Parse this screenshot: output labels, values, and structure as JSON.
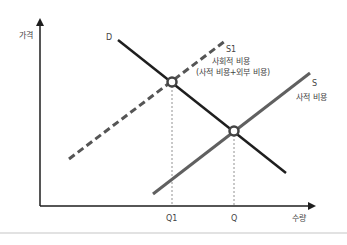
{
  "diagram": {
    "type": "supply-demand-externality",
    "axes": {
      "y_label": "가격",
      "x_label": "수량"
    },
    "curves": {
      "demand": {
        "label": "D",
        "color": "#1e1e1e",
        "style": "solid"
      },
      "social_supply": {
        "label": "S1",
        "caption_line1": "사회적 비용",
        "caption_line2": "(사적 비용+외부 비용)",
        "color": "#555555",
        "style": "dashed"
      },
      "private_supply": {
        "label": "S",
        "caption": "사적 비용",
        "color": "#606060",
        "style": "solid"
      }
    },
    "equilibria": [
      {
        "name": "social-optimum",
        "x_label": "Q1"
      },
      {
        "name": "market-equilibrium",
        "x_label": "Q"
      }
    ]
  }
}
